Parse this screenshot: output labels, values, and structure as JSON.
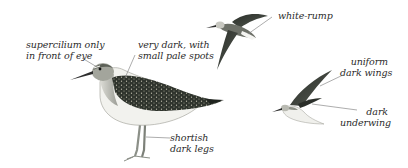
{
  "figure": {
    "type": "field-guide identification plate",
    "subjects": [
      "standing-bird",
      "flying-bird-upper",
      "flying-bird-lower"
    ]
  },
  "labels": {
    "supercilium": {
      "line1": "supercilium only",
      "line2": "in front of eye"
    },
    "upperparts": {
      "line1": "very dark, with",
      "line2": "small pale spots"
    },
    "legs": {
      "line1": "shortish",
      "line2": "dark legs"
    },
    "rump": {
      "line1": "white-rump"
    },
    "wings": {
      "line1": "uniform",
      "line2": "dark wings"
    },
    "underwing": {
      "line1": "dark",
      "line2": "underwing"
    }
  },
  "colors": {
    "text": "#2b2b2b",
    "leader_line": "#8a8a8a",
    "plumage_dark": "#2e332c",
    "plumage_mid": "#6b6f66",
    "underparts": "#f2f2ee",
    "legs": "#8c9088"
  }
}
